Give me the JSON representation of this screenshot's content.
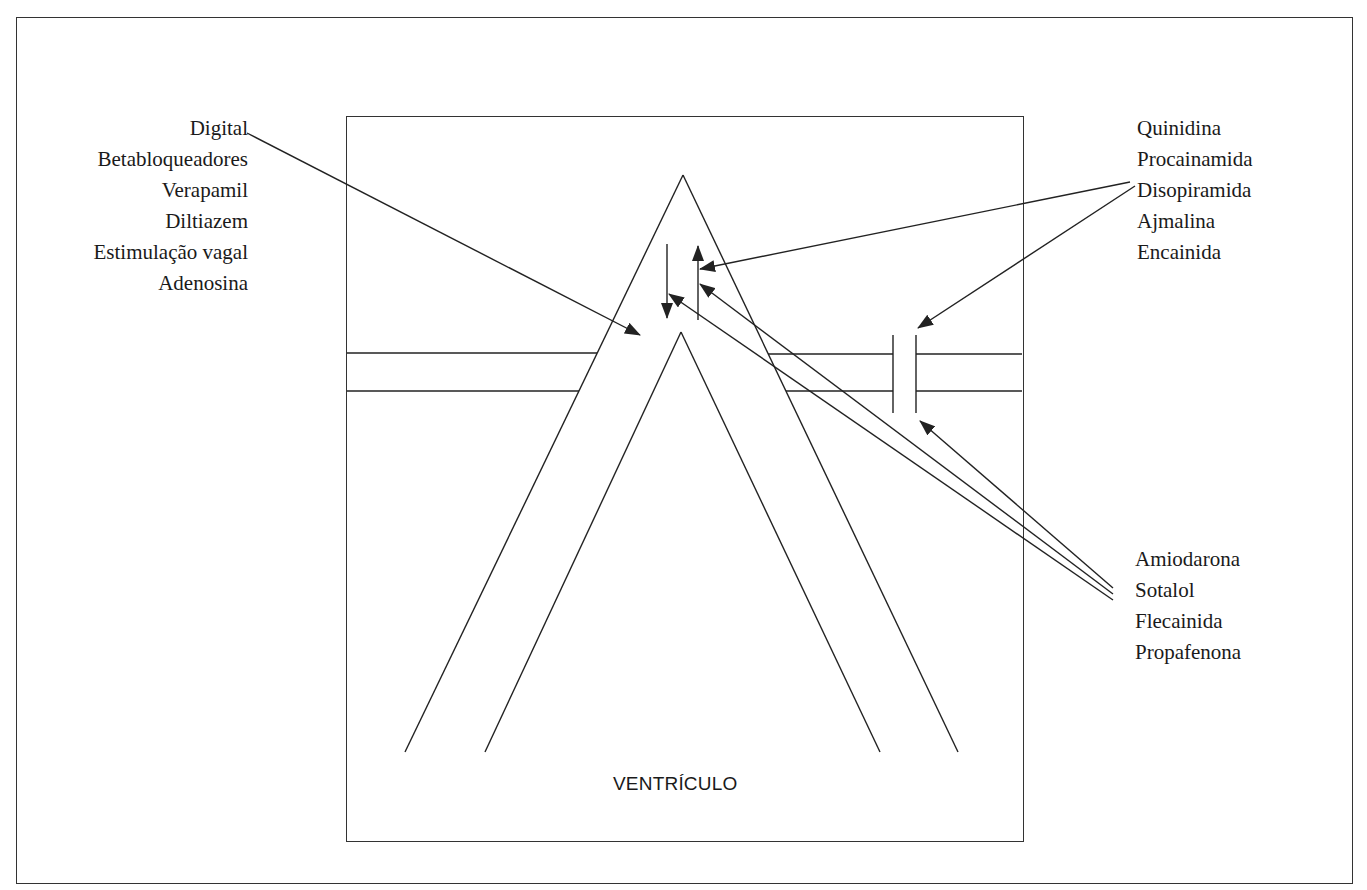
{
  "diagram": {
    "region_label": "VENTRÍCULO",
    "groups": {
      "left_top": {
        "items": [
          "Digital",
          "Betabloqueadores",
          "Verapamil",
          "Diltiazem",
          "Estimulação vagal",
          "Adenosina"
        ]
      },
      "right_top": {
        "items": [
          "Quinidina",
          "Procainamida",
          "Disopiramida",
          "Ajmalina",
          "Encainida"
        ]
      },
      "right_bottom": {
        "items": [
          "Amiodarona",
          "Sotalol",
          "Flecainida",
          "Propafenona"
        ]
      }
    },
    "colors": {
      "line": "#222222",
      "text": "#1a1a1a",
      "background": "#ffffff"
    }
  }
}
